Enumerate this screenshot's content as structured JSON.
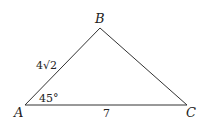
{
  "diagram": {
    "type": "triangle",
    "vertices": {
      "A": {
        "label": "A",
        "x": 25,
        "y": 105
      },
      "B": {
        "label": "B",
        "x": 100,
        "y": 28
      },
      "C": {
        "label": "C",
        "x": 187,
        "y": 105
      }
    },
    "side_AB_label": "4√2",
    "side_AC_label": "7",
    "angle_A_label": "45°",
    "stroke_color": "#333333"
  }
}
